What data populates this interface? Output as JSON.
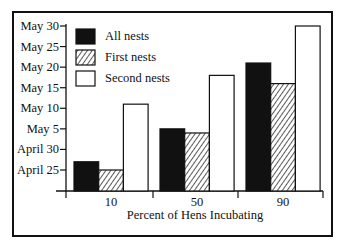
{
  "chart_data": {
    "type": "bar",
    "title": "",
    "xlabel": "Percent of Hens Incubating",
    "ylabel": "",
    "categories": [
      "10",
      "50",
      "90"
    ],
    "series": [
      {
        "name": "All nests",
        "fill": "solid-black",
        "values": [
          "April 27",
          "May 5",
          "May 21"
        ],
        "day_offsets_from_april_25": [
          2,
          10,
          26
        ]
      },
      {
        "name": "First nests",
        "fill": "hatched",
        "values": [
          "April 25",
          "May 4",
          "May 16"
        ],
        "day_offsets_from_april_25": [
          0,
          9,
          21
        ]
      },
      {
        "name": "Second nests",
        "fill": "white",
        "values": [
          "May 11",
          "May 18",
          "May 30"
        ],
        "day_offsets_from_april_25": [
          16,
          23,
          35
        ]
      }
    ],
    "y_ticks": [
      "April 25",
      "April 30",
      "May 5",
      "May 10",
      "May 15",
      "May 20",
      "May 25",
      "May 30"
    ],
    "y_tick_offsets": [
      0,
      5,
      10,
      15,
      20,
      25,
      30,
      35
    ],
    "ylim_offsets": [
      -5,
      35
    ],
    "grid": false,
    "legend_position": "upper-left"
  },
  "legend": [
    {
      "label": "All nests"
    },
    {
      "label": "First nests"
    },
    {
      "label": "Second nests"
    }
  ],
  "colors": {
    "ink": "#111111",
    "background": "#ffffff"
  }
}
